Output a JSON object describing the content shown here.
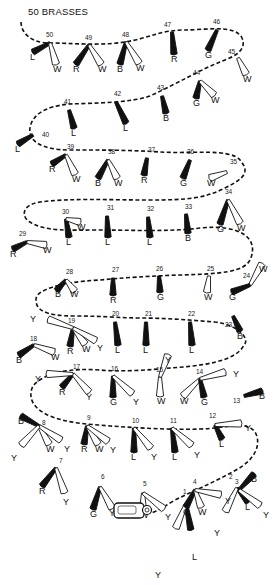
{
  "title": "50 BRASSES",
  "colors": {
    "ink": "#111111",
    "paper": "#ffffff"
  },
  "legend_codes": {
    "L": "leather/black",
    "W": "white",
    "R": "red",
    "B": "blue",
    "G": "green",
    "Y": "yellow"
  },
  "path_d": "M21,22 C21,32 30,43 50,43 C70,43 100,46 125,42 C150,38 160,30 185,30 C205,30 235,24 242,38 C248,52 230,58 220,62 C200,70 180,82 150,96 C130,103 95,103 70,104 C45,106 32,115 30,128 C28,140 40,150 70,150 C100,150 130,150 160,152 C190,154 230,148 240,160 C250,172 245,178 225,188 C205,198 190,200 150,200 C110,200 70,198 40,202 C20,205 22,218 30,222 C45,232 70,230 100,230 C130,230 170,232 200,228 C240,224 260,238 250,260 C244,272 220,274 180,275 C150,276 120,278 100,280 C60,282 35,290 36,300 C36,310 45,316 75,316 C105,316 120,318 140,318 C165,318 190,320 215,322 C240,325 250,340 244,345 C236,362 200,366 170,368 C150,370 120,372 100,370 C70,368 45,372 33,386 C28,396 31,408 50,416 C70,424 90,424 110,426 C140,428 170,430 200,429 C230,428 245,420 255,432 C262,444 255,460 236,470 C215,482 195,490 175,500 C165,506 157,512 150,513",
  "brasses": [
    {
      "n": "1",
      "x": 186,
      "y": 504,
      "tassels": [
        {
          "c": "L",
          "side": "b",
          "fill": "dark",
          "lx": 195,
          "ly": 560
        },
        {
          "c": "Y",
          "side": "b",
          "fill": "light",
          "lx": 158,
          "ly": 578
        }
      ],
      "lx": 183,
      "ly": 494
    },
    {
      "n": "2",
      "x": 237,
      "y": 488,
      "tassels": [
        {
          "c": "L",
          "side": "b",
          "fill": "dark",
          "lx": 248,
          "ly": 510
        },
        {
          "c": "Y",
          "side": "b",
          "fill": "light",
          "lx": 217,
          "ly": 536
        }
      ],
      "lx": 229,
      "ly": 479
    },
    {
      "n": "3",
      "x": 239,
      "y": 490,
      "tassels": [
        {
          "c": "B",
          "side": "b",
          "fill": "dark",
          "lx": 254,
          "ly": 482
        },
        {
          "c": "Y",
          "side": "b",
          "fill": "light",
          "lx": 266,
          "ly": 518
        }
      ],
      "lx": 235,
      "ly": 484
    },
    {
      "n": "4",
      "x": 195,
      "y": 490,
      "tassels": [
        {
          "c": "G",
          "side": "b",
          "fill": "dark",
          "lx": 186,
          "ly": 515
        },
        {
          "c": "W",
          "side": "b",
          "fill": "light",
          "lx": 201,
          "ly": 515
        },
        {
          "c": "Y",
          "side": "b",
          "fill": "light",
          "lx": 228,
          "ly": 504
        }
      ],
      "lx": 193,
      "ly": 484
    },
    {
      "n": "5",
      "x": 143,
      "y": 493,
      "tassels": [
        {
          "c": "W",
          "side": "b",
          "fill": "light",
          "lx": 143,
          "ly": 518
        },
        {
          "c": "Y",
          "side": "b",
          "fill": "light",
          "lx": 168,
          "ly": 520
        }
      ],
      "lx": 143,
      "ly": 486
    },
    {
      "n": "6",
      "x": 100,
      "y": 487,
      "tassels": [
        {
          "c": "G",
          "side": "b",
          "fill": "dark",
          "lx": 93,
          "ly": 517
        },
        {
          "c": "Y",
          "side": "b",
          "fill": "light",
          "lx": 112,
          "ly": 516
        }
      ],
      "lx": 101,
      "ly": 479
    },
    {
      "n": "7",
      "x": 56,
      "y": 468,
      "tassels": [
        {
          "c": "R",
          "side": "b",
          "fill": "dark",
          "lx": 42,
          "ly": 494
        },
        {
          "c": "Y",
          "side": "b",
          "fill": "light",
          "lx": 66,
          "ly": 505
        }
      ],
      "lx": 59,
      "ly": 463
    },
    {
      "n": "8",
      "x": 39,
      "y": 426,
      "tassels": [
        {
          "c": "B",
          "side": "b",
          "fill": "dark",
          "lx": 21,
          "ly": 424
        },
        {
          "c": "W",
          "side": "b",
          "fill": "light",
          "lx": 49,
          "ly": 452
        },
        {
          "c": "Y",
          "side": "b",
          "fill": "light",
          "lx": 67,
          "ly": 452
        },
        {
          "c": "Y",
          "side": "b",
          "fill": "light",
          "lx": 14,
          "ly": 461
        }
      ],
      "lx": 42,
      "ly": 425
    },
    {
      "n": "9",
      "x": 87,
      "y": 426,
      "tassels": [
        {
          "c": "R",
          "side": "b",
          "fill": "dark",
          "lx": 84,
          "ly": 452
        },
        {
          "c": "W",
          "side": "b",
          "fill": "light",
          "lx": 98,
          "ly": 452
        },
        {
          "c": "Y",
          "side": "b",
          "fill": "light",
          "lx": 113,
          "ly": 453
        }
      ],
      "lx": 87,
      "ly": 420
    },
    {
      "n": "10",
      "x": 134,
      "y": 428,
      "tassels": [
        {
          "c": "L",
          "side": "b",
          "fill": "dark",
          "lx": 134,
          "ly": 460
        },
        {
          "c": "Y",
          "side": "b",
          "fill": "light",
          "lx": 154,
          "ly": 460
        }
      ],
      "lx": 132,
      "ly": 423
    },
    {
      "n": "11",
      "x": 172,
      "y": 428,
      "tassels": [
        {
          "c": "L",
          "side": "b",
          "fill": "dark",
          "lx": 175,
          "ly": 460
        },
        {
          "c": "Y",
          "side": "b",
          "fill": "light",
          "lx": 197,
          "ly": 458
        }
      ],
      "lx": 170,
      "ly": 423
    },
    {
      "n": "12",
      "x": 215,
      "y": 425,
      "tassels": [
        {
          "c": "L",
          "side": "b",
          "fill": "dark",
          "lx": 222,
          "ly": 447
        },
        {
          "c": "Y",
          "side": "b",
          "fill": "light",
          "lx": 248,
          "ly": 431
        }
      ],
      "lx": 209,
      "ly": 418
    },
    {
      "n": "13",
      "x": 244,
      "y": 396,
      "tassels": [
        {
          "c": "B",
          "side": "b",
          "fill": "dark",
          "lx": 262,
          "ly": 399
        }
      ],
      "lx": 233,
      "ly": 403
    },
    {
      "n": "14",
      "x": 200,
      "y": 379,
      "tassels": [
        {
          "c": "W",
          "side": "b",
          "fill": "light",
          "lx": 183,
          "ly": 404
        },
        {
          "c": "G",
          "side": "b",
          "fill": "dark",
          "lx": 204,
          "ly": 405
        },
        {
          "c": "Y",
          "side": "b",
          "fill": "light",
          "lx": 236,
          "ly": 377
        }
      ],
      "lx": 196,
      "ly": 374
    },
    {
      "n": "15",
      "x": 160,
      "y": 377,
      "tassels": [
        {
          "c": "W",
          "side": "b",
          "fill": "light",
          "lx": 160,
          "ly": 404
        },
        {
          "c": "Y",
          "side": "b",
          "fill": "light",
          "lx": 168,
          "ly": 363
        }
      ],
      "lx": 156,
      "ly": 372
    },
    {
      "n": "16",
      "x": 113,
      "y": 376,
      "tassels": [
        {
          "c": "G",
          "side": "b",
          "fill": "dark",
          "lx": 113,
          "ly": 405
        },
        {
          "c": "Y",
          "side": "b",
          "fill": "light",
          "lx": 136,
          "ly": 405
        }
      ],
      "lx": 111,
      "ly": 371
    },
    {
      "n": "17",
      "x": 73,
      "y": 374,
      "tassels": [
        {
          "c": "R",
          "side": "b",
          "fill": "dark",
          "lx": 62,
          "ly": 395
        },
        {
          "c": "Y",
          "side": "b",
          "fill": "light",
          "lx": 89,
          "ly": 400
        },
        {
          "c": "Y",
          "side": "b",
          "fill": "light",
          "lx": 38,
          "ly": 382
        }
      ],
      "lx": 73,
      "ly": 369
    },
    {
      "n": "18",
      "x": 34,
      "y": 345,
      "tassels": [
        {
          "c": "B",
          "side": "b",
          "fill": "dark",
          "lx": 19,
          "ly": 363
        },
        {
          "c": "W",
          "side": "b",
          "fill": "light",
          "lx": 54,
          "ly": 360
        }
      ],
      "lx": 30,
      "ly": 341
    },
    {
      "n": "19",
      "x": 73,
      "y": 328,
      "tassels": [
        {
          "c": "R",
          "side": "b",
          "fill": "dark",
          "lx": 70,
          "ly": 354
        },
        {
          "c": "W",
          "side": "b",
          "fill": "light",
          "lx": 85,
          "ly": 352
        },
        {
          "c": "Y",
          "side": "b",
          "fill": "light",
          "lx": 100,
          "ly": 351
        },
        {
          "c": "Y",
          "side": "b",
          "fill": "light",
          "lx": 33,
          "ly": 322
        }
      ],
      "lx": 68,
      "ly": 323
    },
    {
      "n": "20",
      "x": 115,
      "y": 322,
      "tassels": [
        {
          "c": "L",
          "side": "b",
          "fill": "dark",
          "lx": 118,
          "ly": 353
        }
      ],
      "lx": 112,
      "ly": 316
    },
    {
      "n": "21",
      "x": 146,
      "y": 322,
      "tassels": [
        {
          "c": "L",
          "side": "b",
          "fill": "dark",
          "lx": 146,
          "ly": 353
        }
      ],
      "lx": 145,
      "ly": 316
    },
    {
      "n": "22",
      "x": 190,
      "y": 322,
      "tassels": [
        {
          "c": "L",
          "side": "b",
          "fill": "dark",
          "lx": 192,
          "ly": 353
        }
      ],
      "lx": 188,
      "ly": 316
    },
    {
      "n": "23",
      "x": 233,
      "y": 316,
      "tassels": [
        {
          "c": "B",
          "side": "b",
          "fill": "dark",
          "lx": 240,
          "ly": 339
        }
      ],
      "lx": 225,
      "ly": 327
    },
    {
      "n": "24",
      "x": 250,
      "y": 285,
      "tassels": [
        {
          "c": "W",
          "side": "b",
          "fill": "light",
          "lx": 262,
          "ly": 272
        },
        {
          "c": "G",
          "side": "b",
          "fill": "dark",
          "lx": 232,
          "ly": 300
        }
      ],
      "lx": 243,
      "ly": 278
    },
    {
      "n": "25",
      "x": 209,
      "y": 276,
      "tassels": [
        {
          "c": "W",
          "side": "b",
          "fill": "light",
          "lx": 207,
          "ly": 300
        }
      ],
      "lx": 207,
      "ly": 271
    },
    {
      "n": "26",
      "x": 159,
      "y": 276,
      "tassels": [
        {
          "c": "G",
          "side": "b",
          "fill": "dark",
          "lx": 160,
          "ly": 300
        }
      ],
      "lx": 156,
      "ly": 271
    },
    {
      "n": "27",
      "x": 113,
      "y": 278,
      "tassels": [
        {
          "c": "R",
          "side": "b",
          "fill": "dark",
          "lx": 113,
          "ly": 303
        }
      ],
      "lx": 112,
      "ly": 272
    },
    {
      "n": "28",
      "x": 66,
      "y": 280,
      "tassels": [
        {
          "c": "B",
          "side": "b",
          "fill": "dark",
          "lx": 58,
          "ly": 297
        },
        {
          "c": "W",
          "side": "b",
          "fill": "light",
          "lx": 73,
          "ly": 297
        }
      ],
      "lx": 66,
      "ly": 274
    },
    {
      "n": "29",
      "x": 27,
      "y": 242,
      "tassels": [
        {
          "c": "R",
          "side": "b",
          "fill": "dark",
          "lx": 13,
          "ly": 257
        },
        {
          "c": "W",
          "side": "b",
          "fill": "light",
          "lx": 46,
          "ly": 253
        }
      ],
      "lx": 19,
      "ly": 236
    },
    {
      "n": "30",
      "x": 66,
      "y": 219,
      "tassels": [
        {
          "c": "L",
          "side": "b",
          "fill": "dark",
          "lx": 69,
          "ly": 245
        },
        {
          "c": "W",
          "side": "b",
          "fill": "light",
          "lx": 80,
          "ly": 230
        }
      ],
      "lx": 62,
      "ly": 214
    },
    {
      "n": "31",
      "x": 107,
      "y": 216,
      "tassels": [
        {
          "c": "L",
          "side": "b",
          "fill": "dark",
          "lx": 108,
          "ly": 245
        }
      ],
      "lx": 107,
      "ly": 210
    },
    {
      "n": "32",
      "x": 148,
      "y": 217,
      "tassels": [
        {
          "c": "L",
          "side": "b",
          "fill": "dark",
          "lx": 150,
          "ly": 245
        }
      ],
      "lx": 147,
      "ly": 211
    },
    {
      "n": "33",
      "x": 186,
      "y": 214,
      "tassels": [
        {
          "c": "B",
          "side": "b",
          "fill": "dark",
          "lx": 188,
          "ly": 241
        }
      ],
      "lx": 185,
      "ly": 209
    },
    {
      "n": "34",
      "x": 228,
      "y": 200,
      "tassels": [
        {
          "c": "G",
          "side": "b",
          "fill": "dark",
          "lx": 220,
          "ly": 232
        },
        {
          "c": "W",
          "side": "b",
          "fill": "light",
          "lx": 240,
          "ly": 231
        }
      ],
      "lx": 225,
      "ly": 194
    },
    {
      "n": "35",
      "x": 227,
      "y": 172,
      "tassels": [
        {
          "c": "W",
          "side": "b",
          "fill": "light",
          "lx": 210,
          "ly": 186
        }
      ],
      "lx": 230,
      "ly": 164
    },
    {
      "n": "36",
      "x": 190,
      "y": 160,
      "tassels": [
        {
          "c": "G",
          "side": "b",
          "fill": "dark",
          "lx": 183,
          "ly": 186
        }
      ],
      "lx": 187,
      "ly": 154
    },
    {
      "n": "37",
      "x": 147,
      "y": 158,
      "tassels": [
        {
          "c": "R",
          "side": "b",
          "fill": "dark",
          "lx": 144,
          "ly": 183
        }
      ],
      "lx": 148,
      "ly": 152
    },
    {
      "n": "38",
      "x": 108,
      "y": 160,
      "tassels": [
        {
          "c": "B",
          "side": "b",
          "fill": "dark",
          "lx": 98,
          "ly": 186
        },
        {
          "c": "W",
          "side": "b",
          "fill": "light",
          "lx": 117,
          "ly": 186
        }
      ],
      "lx": 108,
      "ly": 154
    },
    {
      "n": "39",
      "x": 66,
      "y": 155,
      "tassels": [
        {
          "c": "R",
          "side": "b",
          "fill": "dark",
          "lx": 52,
          "ly": 172
        },
        {
          "c": "W",
          "side": "b",
          "fill": "light",
          "lx": 75,
          "ly": 182
        }
      ],
      "lx": 67,
      "ly": 149
    },
    {
      "n": "40",
      "x": 33,
      "y": 135,
      "tassels": [
        {
          "c": "L",
          "side": "b",
          "fill": "dark",
          "lx": 18,
          "ly": 152
        }
      ],
      "lx": 42,
      "ly": 137
    },
    {
      "n": "41",
      "x": 69,
      "y": 110,
      "tassels": [
        {
          "c": "L",
          "side": "b",
          "fill": "dark",
          "lx": 74,
          "ly": 136
        }
      ],
      "lx": 64,
      "ly": 104
    },
    {
      "n": "42",
      "x": 116,
      "y": 102,
      "tassels": [
        {
          "c": "L",
          "side": "b",
          "fill": "dark",
          "lx": 126,
          "ly": 131
        }
      ],
      "lx": 114,
      "ly": 96
    },
    {
      "n": "43",
      "x": 162,
      "y": 96,
      "tassels": [
        {
          "c": "B",
          "side": "b",
          "fill": "dark",
          "lx": 166,
          "ly": 121
        }
      ],
      "lx": 157,
      "ly": 90
    },
    {
      "n": "44",
      "x": 200,
      "y": 81,
      "tassels": [
        {
          "c": "G",
          "side": "b",
          "fill": "dark",
          "lx": 196,
          "ly": 106
        },
        {
          "c": "W",
          "side": "b",
          "fill": "light",
          "lx": 214,
          "ly": 103
        }
      ],
      "lx": 193,
      "ly": 75
    },
    {
      "n": "45",
      "x": 238,
      "y": 58,
      "tassels": [
        {
          "c": "W",
          "side": "b",
          "fill": "light",
          "lx": 246,
          "ly": 82
        }
      ],
      "lx": 228,
      "ly": 54
    },
    {
      "n": "46",
      "x": 217,
      "y": 30,
      "tassels": [
        {
          "c": "G",
          "side": "b",
          "fill": "dark",
          "lx": 208,
          "ly": 58
        }
      ],
      "lx": 213,
      "ly": 24
    },
    {
      "n": "47",
      "x": 172,
      "y": 32,
      "tassels": [
        {
          "c": "R",
          "side": "b",
          "fill": "dark",
          "lx": 174,
          "ly": 62
        }
      ],
      "lx": 164,
      "ly": 27
    },
    {
      "n": "48",
      "x": 126,
      "y": 42,
      "tassels": [
        {
          "c": "B",
          "side": "b",
          "fill": "dark",
          "lx": 120,
          "ly": 72
        },
        {
          "c": "W",
          "side": "b",
          "fill": "light",
          "lx": 139,
          "ly": 71
        }
      ],
      "lx": 122,
      "ly": 37
    },
    {
      "n": "49",
      "x": 89,
      "y": 45,
      "tassels": [
        {
          "c": "R",
          "side": "b",
          "fill": "dark",
          "lx": 76,
          "ly": 72
        },
        {
          "c": "W",
          "side": "b",
          "fill": "light",
          "lx": 101,
          "ly": 72
        }
      ],
      "lx": 85,
      "ly": 40
    },
    {
      "n": "50",
      "x": 50,
      "y": 43,
      "tassels": [
        {
          "c": "L",
          "side": "b",
          "fill": "dark",
          "lx": 33,
          "ly": 60
        },
        {
          "c": "W",
          "side": "b",
          "fill": "light",
          "lx": 56,
          "ly": 72
        }
      ],
      "lx": 46,
      "ly": 37
    }
  ]
}
